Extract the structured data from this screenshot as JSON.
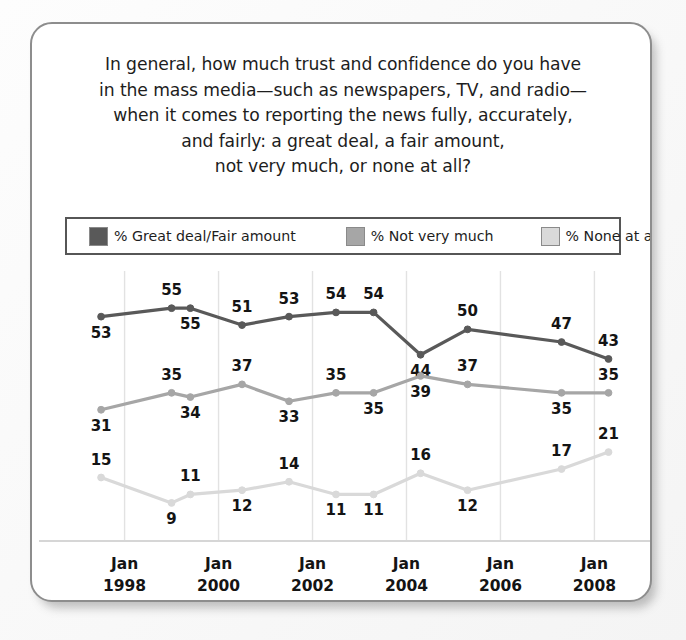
{
  "card": {
    "title_lines": [
      "In general, how much trust and confidence do you have",
      "in the mass media—such as newspapers, TV, and radio—",
      "when it comes to reporting the news fully, accurately,",
      "and fairly: a great deal, a fair amount,",
      "not very much, or none at all?"
    ]
  },
  "legend": {
    "items": [
      {
        "label": "% Great deal/Fair amount",
        "color": "#595959"
      },
      {
        "label": "% Not very much",
        "color": "#a6a6a6"
      },
      {
        "label": "% None at all",
        "color": "#d9d9d9"
      }
    ]
  },
  "chart_data": {
    "type": "line",
    "xlabel": "",
    "ylabel": "",
    "ylim": [
      0,
      60
    ],
    "grid": "vertical-only",
    "legend_position": "top",
    "x": [
      1997.5,
      1999.0,
      1999.4,
      2000.5,
      2001.5,
      2002.5,
      2003.3,
      2004.3,
      2005.3,
      2007.3,
      2008.3
    ],
    "tick_labels": [
      "Jan\n1998",
      "Jan\n2000",
      "Jan\n2002",
      "Jan\n2004",
      "Jan\n2006",
      "Jan\n2008"
    ],
    "tick_lines": [
      "Jan",
      "1998",
      "Jan",
      "2000",
      "Jan",
      "2002",
      "Jan",
      "2004",
      "Jan",
      "2006",
      "Jan",
      "2008"
    ],
    "xticks": [
      {
        "line1": "Jan",
        "line2": "1998"
      },
      {
        "line1": "Jan",
        "line2": "2000"
      },
      {
        "line1": "Jan",
        "line2": "2002"
      },
      {
        "line1": "Jan",
        "line2": "2004"
      },
      {
        "line1": "Jan",
        "line2": "2006"
      },
      {
        "line1": "Jan",
        "line2": "2008"
      }
    ],
    "series": [
      {
        "name": "% Great deal/Fair amount",
        "color": "#595959",
        "values": [
          53,
          55,
          55,
          51,
          53,
          54,
          54,
          44,
          50,
          47,
          43
        ],
        "label_positions": [
          "below",
          "above",
          "below",
          "above",
          "above",
          "above",
          "above",
          "below",
          "above",
          "above",
          "above"
        ]
      },
      {
        "name": "% Not very much",
        "color": "#a6a6a6",
        "values": [
          31,
          35,
          34,
          37,
          33,
          35,
          35,
          39,
          37,
          35,
          35
        ],
        "label_positions": [
          "below",
          "above",
          "below",
          "above",
          "below",
          "above",
          "below",
          "below",
          "above",
          "below",
          "above"
        ]
      },
      {
        "name": "% None at all",
        "color": "#d9d9d9",
        "values": [
          15,
          9,
          11,
          12,
          14,
          11,
          11,
          16,
          12,
          17,
          21
        ],
        "label_positions": [
          "above",
          "below",
          "above",
          "below",
          "above",
          "below",
          "below",
          "above",
          "below",
          "above",
          "above"
        ]
      }
    ]
  }
}
